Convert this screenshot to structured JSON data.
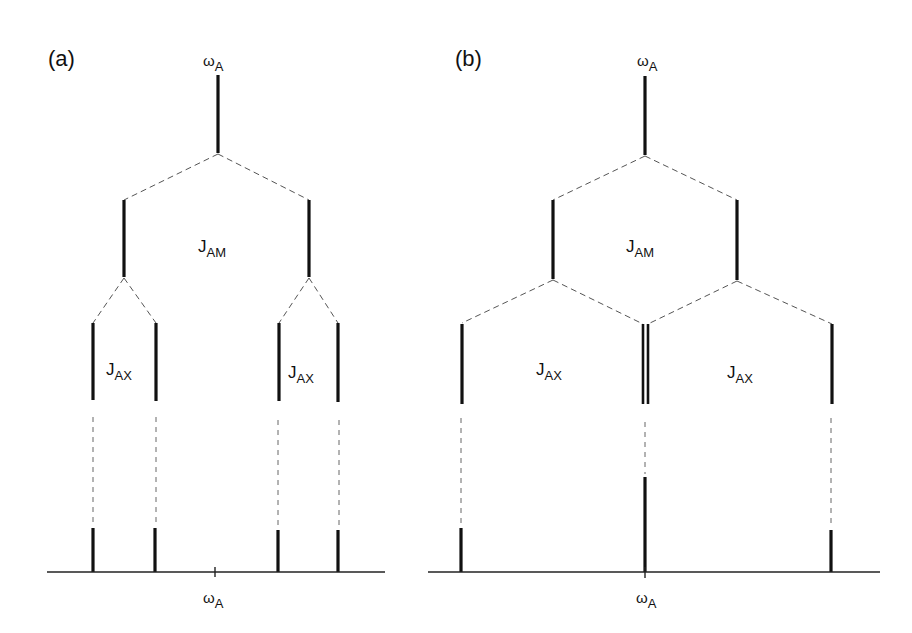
{
  "figure": {
    "panel_a": {
      "label": "(a)",
      "top_freq": {
        "symbol": "ω",
        "subscript": "A"
      },
      "coupling_1": {
        "symbol": "J",
        "subscript": "AM"
      },
      "coupling_2_left": {
        "symbol": "J",
        "subscript": "AX"
      },
      "coupling_2_right": {
        "symbol": "J",
        "subscript": "AX"
      },
      "axis_freq": {
        "symbol": "ω",
        "subscript": "A"
      },
      "final_lines": 4
    },
    "panel_b": {
      "label": "(b)",
      "top_freq": {
        "symbol": "ω",
        "subscript": "A"
      },
      "coupling_1": {
        "symbol": "J",
        "subscript": "AM"
      },
      "coupling_2_left": {
        "symbol": "J",
        "subscript": "AX"
      },
      "coupling_2_right": {
        "symbol": "J",
        "subscript": "AX"
      },
      "axis_freq": {
        "symbol": "ω",
        "subscript": "A"
      },
      "final_lines": 3,
      "final_intensity_ratio": "1:2:1"
    },
    "colors": {
      "line": "#111111",
      "dashed": "#555555",
      "background": "#ffffff"
    }
  }
}
